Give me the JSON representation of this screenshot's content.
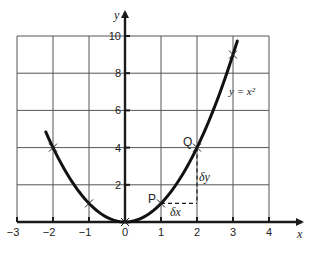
{
  "chart_data": {
    "type": "line",
    "title": "",
    "function": "y = x^2",
    "xlabel": "x",
    "ylabel": "y",
    "xlim": [
      -3,
      4
    ],
    "ylim": [
      0,
      10
    ],
    "grid": true,
    "x_ticks": [
      -3,
      -2,
      -1,
      0,
      1,
      2,
      3,
      4
    ],
    "x_tick_labels": [
      "−3",
      "−2",
      "−1",
      "0",
      "1",
      "2",
      "3",
      "4"
    ],
    "y_ticks": [
      2,
      4,
      6,
      8,
      10
    ],
    "y_tick_labels": [
      "2",
      "4",
      "6",
      "8",
      "10"
    ],
    "series": [
      {
        "name": "y = x²",
        "x": [
          -2.2,
          -2,
          -1.5,
          -1,
          -0.5,
          0,
          0.5,
          1,
          1.5,
          2,
          2.5,
          3,
          3.12
        ],
        "y": [
          4.84,
          4,
          2.25,
          1,
          0.25,
          0,
          0.25,
          1,
          2.25,
          4,
          6.25,
          9,
          9.73
        ]
      }
    ],
    "marked_points": [
      {
        "x": -2,
        "y": 4
      },
      {
        "x": -1,
        "y": 1
      },
      {
        "x": 0,
        "y": 0
      },
      {
        "x": 1,
        "y": 1
      },
      {
        "x": 2,
        "y": 4
      },
      {
        "x": 3,
        "y": 9
      }
    ],
    "annotations": [
      {
        "text": "P",
        "x": 1,
        "y": 1
      },
      {
        "text": "Q",
        "x": 2,
        "y": 4
      },
      {
        "text": "δx",
        "note": "horizontal dashed segment from P (1,1) to (2,1)"
      },
      {
        "text": "δy",
        "note": "vertical dashed segment from (2,1) to Q (2,4)"
      },
      {
        "text": "y = x²",
        "note": "curve label near x=3, y=6.5"
      }
    ]
  },
  "labels": {
    "x_axis": "x",
    "y_axis": "y",
    "point_p": "P",
    "point_q": "Q",
    "delta_x": "δx",
    "delta_y": "δy",
    "curve": "y = x²",
    "x_ticks": [
      "−3",
      "−2",
      "−1",
      "0",
      "1",
      "2",
      "3",
      "4"
    ],
    "y_ticks": [
      "2",
      "4",
      "6",
      "8",
      "10"
    ]
  },
  "colors": {
    "ink": "#1a1a1a",
    "grid": "#555555",
    "background": "#ffffff"
  }
}
